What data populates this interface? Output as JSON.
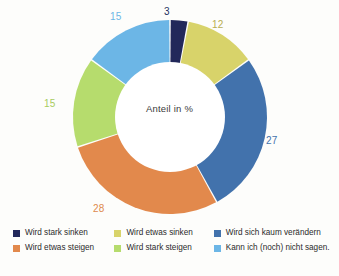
{
  "chart_data": {
    "type": "pie",
    "variant": "donut",
    "title": "",
    "center_label": "Anteil in %",
    "unit": "%",
    "total": 100,
    "start_angle_deg": 0,
    "direction": "clockwise",
    "categories": [
      "Wird stark sinken",
      "Wird etwas sinken",
      "Wird sich kaum verändern",
      "Wird etwas steigen",
      "Wird stark steigen",
      "Kann ich (noch) nicht sagen."
    ],
    "values": [
      3,
      12,
      27,
      28,
      15,
      15
    ],
    "colors": [
      "#22285a",
      "#d8d36a",
      "#4272ac",
      "#e2894c",
      "#b6dc6d",
      "#6cb6e6"
    ],
    "slices": [
      {
        "label": "Wird stark sinken",
        "value": 3,
        "color": "#22285a",
        "value_text": "3"
      },
      {
        "label": "Wird etwas sinken",
        "value": 12,
        "color": "#d8d36a",
        "value_text": "12"
      },
      {
        "label": "Wird sich kaum verändern",
        "value": 27,
        "color": "#4272ac",
        "value_text": "27"
      },
      {
        "label": "Wird etwas steigen",
        "value": 28,
        "color": "#e2894c",
        "value_text": "28"
      },
      {
        "label": "Wird stark steigen",
        "value": 15,
        "color": "#b6dc6d",
        "value_text": "15"
      },
      {
        "label": "Kann ich (noch) nicht sagen.",
        "value": 15,
        "color": "#6cb6e6",
        "value_text": "15"
      }
    ],
    "legend_position": "bottom",
    "grid": false
  },
  "labels": {
    "v_navy": "3",
    "v_khaki": "12",
    "v_blue": "27",
    "v_orange": "28",
    "v_green": "15",
    "v_lightblue": "15"
  },
  "legend": {
    "columns": [
      {
        "items": [
          {
            "label": "Wird stark sinken",
            "color": "#22285a"
          },
          {
            "label": "Wird etwas steigen",
            "color": "#e2894c"
          }
        ]
      },
      {
        "items": [
          {
            "label": "Wird etwas sinken",
            "color": "#d8d36a"
          },
          {
            "label": "Wird stark steigen",
            "color": "#b6dc6d"
          }
        ]
      },
      {
        "items": [
          {
            "label": "Wird sich kaum verändern",
            "color": "#4272ac"
          },
          {
            "label": "Kann ich (noch) nicht sagen.",
            "color": "#6cb6e6"
          }
        ]
      }
    ]
  }
}
